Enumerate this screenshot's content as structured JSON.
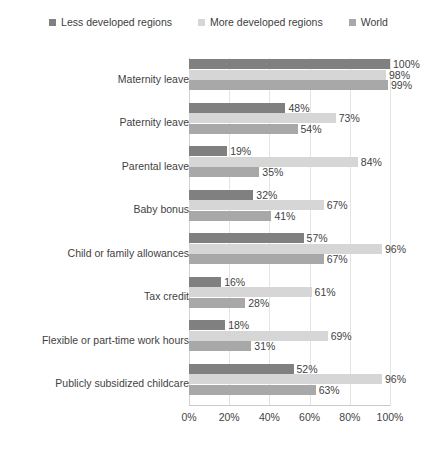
{
  "chart_data": {
    "type": "bar",
    "orientation": "horizontal",
    "grouped": true,
    "title": "",
    "xlabel": "",
    "ylabel": "",
    "xlim": [
      0,
      100
    ],
    "xticks": [
      "0%",
      "20%",
      "40%",
      "60%",
      "80%",
      "100%"
    ],
    "xtick_values": [
      0,
      20,
      40,
      60,
      80,
      100
    ],
    "grid": "vertical",
    "legend_position": "top-center",
    "value_label_suffix": "%",
    "categories": [
      "Maternity leave",
      "Paternity leave",
      "Parental leave",
      "Baby bonus",
      "Child or family allowances",
      "Tax credit",
      "Flexible or part-time work hours",
      "Publicly subsidized childcare"
    ],
    "series": [
      {
        "name": "Less developed regions",
        "color": "#808080",
        "values": [
          100,
          48,
          19,
          32,
          57,
          16,
          18,
          52
        ],
        "labels": [
          "100%",
          "48%",
          "19%",
          "32%",
          "57%",
          "16%",
          "18%",
          "52%"
        ]
      },
      {
        "name": "More developed regions",
        "color": "#d6d6d6",
        "values": [
          98,
          73,
          84,
          67,
          96,
          61,
          69,
          96
        ],
        "labels": [
          "98%",
          "73%",
          "84%",
          "67%",
          "96%",
          "61%",
          "69%",
          "96%"
        ]
      },
      {
        "name": "World",
        "color": "#a8a8a8",
        "values": [
          99,
          54,
          35,
          41,
          67,
          28,
          31,
          63
        ],
        "labels": [
          "99%",
          "54%",
          "35%",
          "41%",
          "67%",
          "28%",
          "31%",
          "63%"
        ]
      }
    ]
  },
  "legend": {
    "items": [
      {
        "label": "Less developed regions",
        "color": "#808080"
      },
      {
        "label": "More developed regions",
        "color": "#d6d6d6"
      },
      {
        "label": "World",
        "color": "#a8a8a8"
      }
    ]
  },
  "colors": {
    "background": "#ffffff",
    "gridline": "#e4e4e4",
    "axis": "#c9c9c9",
    "text": "#3f3f3f"
  }
}
